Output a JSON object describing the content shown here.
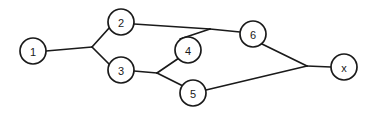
{
  "figure": {
    "background_color": "#ffffff",
    "line_color": "#1a1a1a",
    "node_fill_color": "#ffffff",
    "width": 371,
    "height": 116
  },
  "nodes": [
    {
      "id": "n1",
      "label": "1",
      "cx": 33,
      "cy": 51,
      "r": 13
    },
    {
      "id": "n2",
      "label": "2",
      "cx": 121,
      "cy": 22,
      "r": 13
    },
    {
      "id": "n3",
      "label": "3",
      "cx": 121,
      "cy": 70,
      "r": 13
    },
    {
      "id": "n4",
      "label": "4",
      "cx": 188,
      "cy": 50,
      "r": 13
    },
    {
      "id": "n5",
      "label": "5",
      "cx": 193,
      "cy": 93,
      "r": 13
    },
    {
      "id": "n6",
      "label": "6",
      "cx": 253,
      "cy": 34,
      "r": 13
    },
    {
      "id": "nx",
      "label": "x",
      "cx": 344,
      "cy": 67,
      "r": 13
    }
  ],
  "junctions": [
    {
      "id": "j-left",
      "x": 92,
      "y": 47
    },
    {
      "id": "j-middle",
      "x": 157,
      "y": 73
    },
    {
      "id": "j-top",
      "x": 210,
      "y": 29
    },
    {
      "id": "j-right",
      "x": 307,
      "y": 66
    }
  ],
  "edges": [
    {
      "id": "e-1-j-left",
      "from": "n1",
      "to": "j-left",
      "points": "46,51 92,47"
    },
    {
      "id": "e-j-left-2",
      "from": "j-left",
      "to": "n2",
      "points": "92,47 110,27"
    },
    {
      "id": "e-j-left-3",
      "from": "j-left",
      "to": "n3",
      "points": "92,47 110,65"
    },
    {
      "id": "e-2-j-top",
      "from": "n2",
      "to": "j-top",
      "points": "134,24 210,29"
    },
    {
      "id": "e-j-top-6",
      "from": "j-top",
      "to": "n6",
      "points": "210,29 240,32"
    },
    {
      "id": "e-j-top-4",
      "from": "j-top",
      "to": "n4",
      "points": "210,29 180,39"
    },
    {
      "id": "e-3-j-middle",
      "from": "n3",
      "to": "j-middle",
      "points": "134,71 157,73"
    },
    {
      "id": "e-j-middle-4",
      "from": "j-middle",
      "to": "n4",
      "points": "157,73 179,58"
    },
    {
      "id": "e-j-middle-5",
      "from": "j-middle",
      "to": "n5",
      "points": "157,73 183,86"
    },
    {
      "id": "e-6-j-right",
      "from": "n6",
      "to": "j-right",
      "points": "262,44 307,66"
    },
    {
      "id": "e-5-j-right",
      "from": "n5",
      "to": "j-right",
      "points": "206,90 307,66"
    },
    {
      "id": "e-j-right-x",
      "from": "j-right",
      "to": "nx",
      "points": "307,66 331,67"
    }
  ],
  "adjacency_summary": [
    "1 - 2",
    "1 - 3",
    "2 - 6",
    "2 - 4",
    "3 - 4",
    "3 - 5",
    "4 - 6",
    "5 - x",
    "6 - x"
  ]
}
